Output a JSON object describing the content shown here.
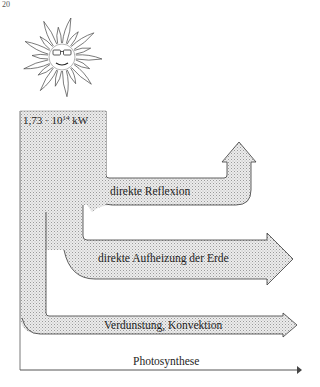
{
  "page": {
    "number": "20"
  },
  "figure": {
    "source": {
      "icon": "sun-icon",
      "power_base": "1,73 · 10",
      "power_exponent": "14",
      "power_unit": "kW"
    },
    "flows": [
      {
        "id": "reflexion",
        "label": "direkte Reflexion",
        "direction": "up"
      },
      {
        "id": "aufheizung",
        "label": "direkte Aufheizung der Erde",
        "direction": "right"
      },
      {
        "id": "verdunstung",
        "label": "Verdunstung, Konvektion",
        "direction": "right"
      },
      {
        "id": "photosynthese",
        "label": "Photosynthese",
        "direction": "right"
      }
    ],
    "colors": {
      "fill": "#d9d9d9",
      "stroke": "#3a3a3a",
      "line": "#555555"
    }
  }
}
